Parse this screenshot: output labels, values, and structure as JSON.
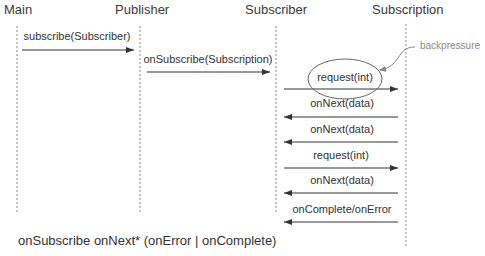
{
  "diagram": {
    "type": "sequence",
    "participants": [
      {
        "id": "main",
        "label": "Main"
      },
      {
        "id": "publisher",
        "label": "Publisher"
      },
      {
        "id": "subscriber",
        "label": "Subscriber"
      },
      {
        "id": "subscription",
        "label": "Subscription"
      }
    ],
    "messages": [
      {
        "from": "main",
        "to": "publisher",
        "label": "subscribe(Subscriber)"
      },
      {
        "from": "publisher",
        "to": "subscriber",
        "label": "onSubscribe(Subscription)"
      },
      {
        "from": "subscriber",
        "to": "subscription",
        "label": "request(int)",
        "highlighted": true
      },
      {
        "from": "subscription",
        "to": "subscriber",
        "label": "onNext(data)"
      },
      {
        "from": "subscription",
        "to": "subscriber",
        "label": "onNext(data)"
      },
      {
        "from": "subscriber",
        "to": "subscription",
        "label": "request(int)"
      },
      {
        "from": "subscription",
        "to": "subscriber",
        "label": "onNext(data)"
      },
      {
        "from": "subscription",
        "to": "subscriber",
        "label": "onComplete/onError"
      }
    ],
    "annotation": {
      "label": "backpressure",
      "target": "request(int)"
    },
    "footer": "onSubscribe onNext* (onError | onComplete)",
    "colors": {
      "line": "#333333",
      "lifeline": "#888888",
      "annotation": "#8a8a8a"
    }
  }
}
